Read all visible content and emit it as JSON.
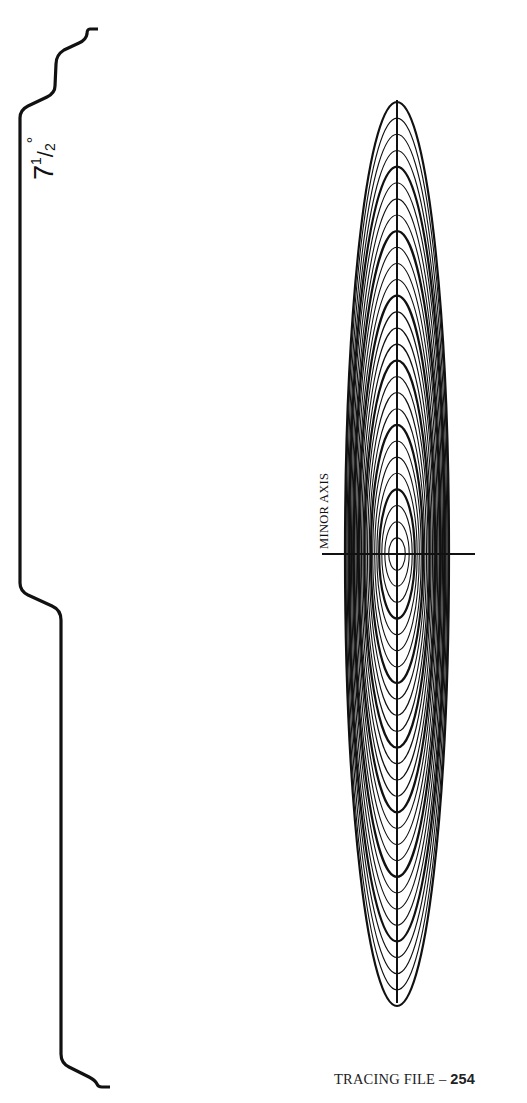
{
  "angle_label": {
    "whole": "7",
    "numerator": "1",
    "slash": "/",
    "denominator": "2",
    "degree": "°",
    "full_text": "7½°"
  },
  "axis_label": "MINOR AXIS",
  "footer": {
    "prefix": "TRACING FILE – ",
    "number": "254"
  },
  "diagram": {
    "type": "ellipse template",
    "ellipse_angle_degrees": 7.5,
    "center": [
      397,
      554
    ],
    "major_axis": {
      "x": 397,
      "y_start": 100,
      "y_end": 1003
    },
    "minor_axis": {
      "y": 554,
      "x_start": 322,
      "x_end": 475
    },
    "ellipse_count": 28,
    "outer_semi_axes": [
      52,
      452
    ],
    "thick_every": 4,
    "stroke_color": "#111111",
    "background_color": "#ffffff"
  }
}
